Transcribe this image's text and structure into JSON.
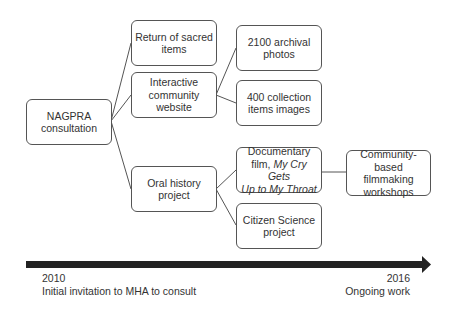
{
  "nodes": {
    "nagpra": {
      "line1": "NAGPRA",
      "line2": "consultation"
    },
    "return": {
      "line1": "Return of sacred",
      "line2": "items"
    },
    "website": {
      "line1": "Interactive",
      "line2": "community",
      "line3": "website"
    },
    "photos": {
      "line1": "2100 archival",
      "line2": "photos"
    },
    "images": {
      "line1": "400 collection",
      "line2": "items images"
    },
    "oral": {
      "line1": "Oral history",
      "line2": "project"
    },
    "film": {
      "line1": "Documentary",
      "line2_a": "film, ",
      "line2_b": "My Cry Gets",
      "line3": "Up to My Throat"
    },
    "citizen": {
      "line1": "Citizen Science",
      "line2": "project"
    },
    "workshops": {
      "line1": "Community-",
      "line2": "based filmmaking",
      "line3": "workshops"
    }
  },
  "timeline": {
    "start_year": "2010",
    "start_label": "Initial invitation to MHA to consult",
    "end_year": "2016",
    "end_label": "Ongoing work"
  }
}
